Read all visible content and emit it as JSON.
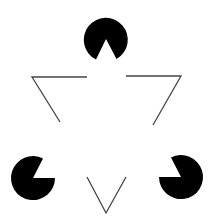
{
  "figure": {
    "title": "",
    "background": "#ffffff",
    "pacman_color": "#000000",
    "line_color": "#444444",
    "pacmen": [
      {
        "id": "top",
        "cx": 106,
        "cy": 39,
        "r": 22,
        "mouth_direction": "down"
      },
      {
        "id": "bottom-left",
        "cx": 33,
        "cy": 178,
        "r": 22,
        "mouth_direction": "upper-right"
      },
      {
        "id": "bottom-right",
        "cx": 181,
        "cy": 177,
        "r": 22,
        "mouth_direction": "upper-left"
      }
    ],
    "outline_segments": [
      {
        "id": "top-left",
        "points": "87,77 32,77 60,122"
      },
      {
        "id": "top-right",
        "points": "126,76 181,76 153,125"
      },
      {
        "id": "bottom-v",
        "points": "87,177 106,213 126,177"
      }
    ]
  }
}
